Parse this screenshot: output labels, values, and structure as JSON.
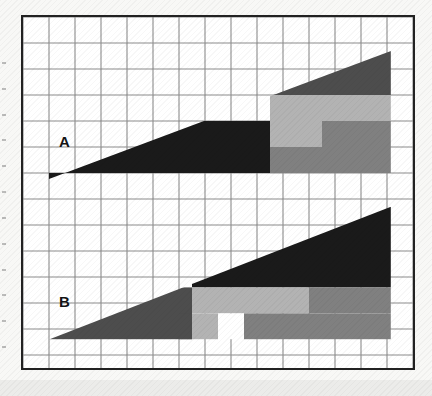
{
  "figure": {
    "background_color": "#f8f8f6",
    "frame_color": "#222222",
    "gridline_color": "#8c8c8c",
    "plot_background": "#ffffff"
  },
  "labels": {
    "panel_a": "A",
    "panel_b": "B"
  },
  "palette": {
    "black": "#1a1a1a",
    "dark_gray": "#4d4d4d",
    "mid_gray": "#808080",
    "light_gray": "#b3b3b3",
    "white": "#ffffff"
  },
  "chart_data": {
    "type": "area",
    "title": "",
    "subtitle": "",
    "xlabel": "",
    "ylabel": "",
    "grid": true,
    "legend_position": "none",
    "grid_columns": 15,
    "grid_rows": 13,
    "cell_size_px": 26,
    "xlim": [
      0,
      15
    ],
    "ylim": [
      0,
      13.65
    ],
    "tick_labels_x": [],
    "tick_labels_y": [],
    "annotations": [
      "A",
      "B"
    ],
    "series": [
      {
        "name": "A",
        "label": "A",
        "baseline_row": 6,
        "apex_left": {
          "x": 1.0,
          "y": 6.23
        },
        "apex_right": {
          "x": 14.15,
          "y": 1.31
        },
        "description": "Right-rising wedge, black fill at left, stacked gray bands at right",
        "segments": [
          {
            "fill": "black",
            "x0": 1.0,
            "x1": 9.5,
            "y0": 4.0,
            "y1": 6.23
          },
          {
            "fill": "dark_gray",
            "x0": 9.5,
            "x1": 14.15,
            "y0": 1.31,
            "y1": 3.0
          },
          {
            "fill": "light_gray",
            "x0": 9.5,
            "x1": 14.15,
            "y0": 3.0,
            "y1": 4.0
          },
          {
            "fill": "light_gray",
            "x0": 9.5,
            "x1": 11.5,
            "y0": 4.0,
            "y1": 5.0
          },
          {
            "fill": "mid_gray",
            "x0": 11.5,
            "x1": 14.15,
            "y0": 4.0,
            "y1": 5.0
          },
          {
            "fill": "mid_gray",
            "x0": 9.5,
            "x1": 14.15,
            "y0": 5.0,
            "y1": 6.23
          }
        ]
      },
      {
        "name": "B",
        "label": "B",
        "baseline_row": 12.4,
        "apex_left": {
          "x": 1.0,
          "y": 12.4
        },
        "apex_right": {
          "x": 14.15,
          "y": 7.3
        },
        "description": "Right-rising wedge, dark fill, stacked gray bands with one white gap cell",
        "segments": [
          {
            "fill": "dark_gray",
            "x0": 1.0,
            "x1": 6.5,
            "y0": 10.4,
            "y1": 12.4
          },
          {
            "fill": "black",
            "x0": 6.5,
            "x1": 14.15,
            "y0": 7.3,
            "y1": 10.4
          },
          {
            "fill": "light_gray",
            "x0": 6.5,
            "x1": 11.0,
            "y0": 10.4,
            "y1": 11.4
          },
          {
            "fill": "mid_gray",
            "x0": 11.0,
            "x1": 14.15,
            "y0": 10.4,
            "y1": 11.4
          },
          {
            "fill": "light_gray",
            "x0": 6.5,
            "x1": 7.5,
            "y0": 11.4,
            "y1": 12.4
          },
          {
            "fill": "white",
            "x0": 7.5,
            "x1": 8.5,
            "y0": 11.4,
            "y1": 12.4
          },
          {
            "fill": "mid_gray",
            "x0": 8.5,
            "x1": 14.15,
            "y0": 11.4,
            "y1": 12.4
          },
          {
            "fill": "dark_gray",
            "x0": 6.0,
            "x1": 6.5,
            "y0": 11.4,
            "y1": 12.4
          }
        ]
      }
    ]
  }
}
